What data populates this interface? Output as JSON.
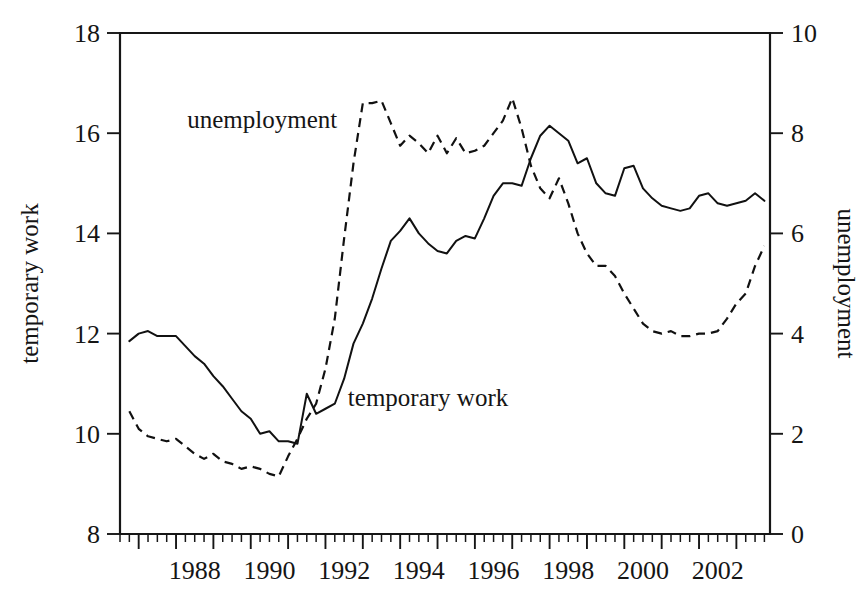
{
  "chart_data": {
    "type": "line",
    "title": "",
    "subtitle": "",
    "xlabel": "",
    "ylabel": "temporary work",
    "y2label": "unemployment",
    "grid": false,
    "legend_position": "inline-annotations",
    "xlim": [
      1986.5,
      2003.9
    ],
    "ylim": [
      8,
      18
    ],
    "y2lim": [
      0,
      10
    ],
    "yticks": [
      8,
      10,
      12,
      14,
      16,
      18
    ],
    "y2ticks": [
      0,
      2,
      4,
      6,
      8,
      10
    ],
    "xticks": [
      1988,
      1990,
      1992,
      1994,
      1996,
      1998,
      2000,
      2002
    ],
    "xticklabels": [
      "1988",
      "1990",
      "1992",
      "1994",
      "1996",
      "1998",
      "2000",
      "2002"
    ],
    "xtick_minor_step": 0.25,
    "annotations": [
      {
        "text": "unemployment",
        "x": 1988.3,
        "y": 16.1,
        "series": "unemployment"
      },
      {
        "text": "temporary work",
        "x": 1992.6,
        "y": 10.55,
        "series": "temporary work"
      }
    ],
    "series": [
      {
        "name": "temporary work",
        "axis": "left",
        "style": "solid",
        "x": [
          1986.75,
          1987.0,
          1987.25,
          1987.5,
          1987.75,
          1988.0,
          1988.25,
          1988.5,
          1988.75,
          1989.0,
          1989.25,
          1989.5,
          1989.75,
          1990.0,
          1990.25,
          1990.5,
          1990.75,
          1991.0,
          1991.25,
          1991.5,
          1991.75,
          1992.0,
          1992.25,
          1992.5,
          1992.75,
          1993.0,
          1993.25,
          1993.5,
          1993.75,
          1994.0,
          1994.25,
          1994.5,
          1994.75,
          1995.0,
          1995.25,
          1995.5,
          1995.75,
          1996.0,
          1996.25,
          1996.5,
          1996.75,
          1997.0,
          1997.25,
          1997.5,
          1997.75,
          1998.0,
          1998.25,
          1998.5,
          1998.75,
          1999.0,
          1999.25,
          1999.5,
          1999.75,
          2000.0,
          2000.25,
          2000.5,
          2000.75,
          2001.0,
          2001.25,
          2001.5,
          2001.75,
          2002.0,
          2002.25,
          2002.5,
          2002.75,
          2003.0,
          2003.25,
          2003.5,
          2003.75
        ],
        "values": [
          11.85,
          12.0,
          12.05,
          11.95,
          11.95,
          11.95,
          11.75,
          11.55,
          11.4,
          11.15,
          10.95,
          10.7,
          10.45,
          10.3,
          10.0,
          10.05,
          9.85,
          9.85,
          9.8,
          10.8,
          10.4,
          10.5,
          10.6,
          11.1,
          11.8,
          12.2,
          12.7,
          13.3,
          13.85,
          14.05,
          14.3,
          14.0,
          13.8,
          13.65,
          13.6,
          13.85,
          13.95,
          13.9,
          14.3,
          14.75,
          15.0,
          15.0,
          14.95,
          15.5,
          15.95,
          16.15,
          16.0,
          15.85,
          15.4,
          15.5,
          15.0,
          14.8,
          14.75,
          15.3,
          15.35,
          14.9,
          14.7,
          14.55,
          14.5,
          14.45,
          14.5,
          14.75,
          14.8,
          14.6,
          14.55,
          14.6,
          14.65,
          14.8,
          14.65
        ]
      },
      {
        "name": "unemployment",
        "axis": "right",
        "style": "dashed",
        "x": [
          1986.75,
          1987.0,
          1987.25,
          1987.5,
          1987.75,
          1988.0,
          1988.25,
          1988.5,
          1988.75,
          1989.0,
          1989.25,
          1989.5,
          1989.75,
          1990.0,
          1990.25,
          1990.5,
          1990.75,
          1991.0,
          1991.25,
          1991.5,
          1991.75,
          1992.0,
          1992.25,
          1992.5,
          1992.75,
          1993.0,
          1993.25,
          1993.5,
          1993.75,
          1994.0,
          1994.25,
          1994.5,
          1994.75,
          1995.0,
          1995.25,
          1995.5,
          1995.75,
          1996.0,
          1996.25,
          1996.5,
          1996.75,
          1997.0,
          1997.25,
          1997.5,
          1997.75,
          1998.0,
          1998.25,
          1998.5,
          1998.75,
          1999.0,
          1999.25,
          1999.5,
          1999.75,
          2000.0,
          2000.25,
          2000.5,
          2000.75,
          2001.0,
          2001.25,
          2001.5,
          2001.75,
          2002.0,
          2002.25,
          2002.5,
          2002.75,
          2003.0,
          2003.25,
          2003.5,
          2003.75
        ],
        "values": [
          2.45,
          2.1,
          1.95,
          1.9,
          1.85,
          1.9,
          1.75,
          1.6,
          1.5,
          1.6,
          1.45,
          1.4,
          1.3,
          1.35,
          1.3,
          1.2,
          1.15,
          1.55,
          1.9,
          2.3,
          2.6,
          3.3,
          4.3,
          5.9,
          7.4,
          8.6,
          8.6,
          8.65,
          8.2,
          7.75,
          7.95,
          7.8,
          7.6,
          7.95,
          7.6,
          7.9,
          7.6,
          7.65,
          7.75,
          8.0,
          8.25,
          8.7,
          8.1,
          7.35,
          6.9,
          6.7,
          7.1,
          6.6,
          6.0,
          5.6,
          5.35,
          5.35,
          5.15,
          4.8,
          4.5,
          4.2,
          4.05,
          4.0,
          4.05,
          3.95,
          3.95,
          4.0,
          4.0,
          4.05,
          4.3,
          4.6,
          4.8,
          5.35,
          5.75
        ]
      }
    ]
  },
  "axes": {
    "left_title": "temporary work",
    "right_title": "unemployment",
    "left_ticks": [
      "18",
      "16",
      "14",
      "12",
      "10",
      "8"
    ],
    "right_ticks": [
      "10",
      "8",
      "6",
      "4",
      "2",
      "0"
    ],
    "x_ticks": [
      "1988",
      "1990",
      "1992",
      "1994",
      "1996",
      "1998",
      "2000",
      "2002"
    ]
  }
}
